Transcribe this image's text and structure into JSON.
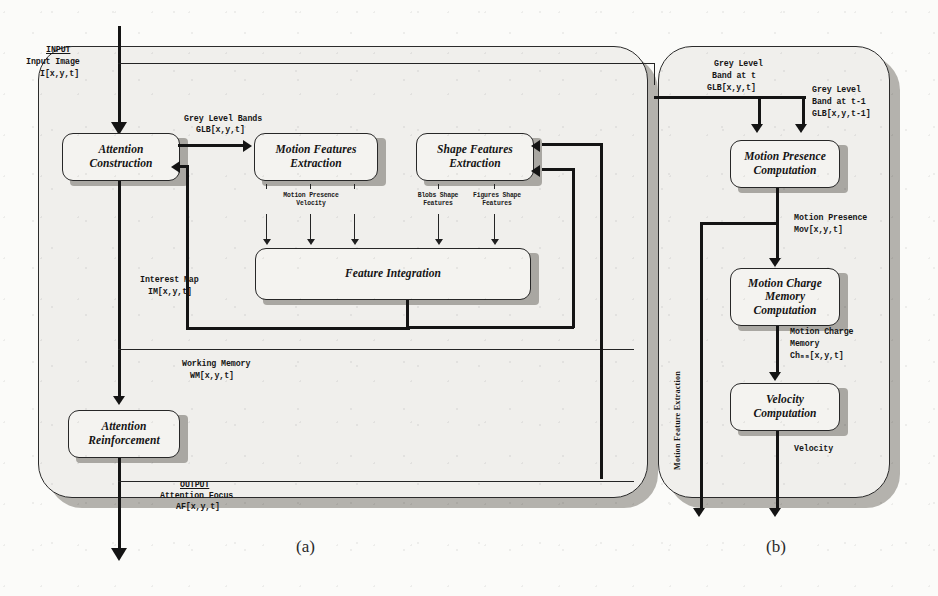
{
  "figure": {
    "captions": {
      "a": "(a)",
      "b": "(b)"
    }
  },
  "panel_a": {
    "input": {
      "heading": "INPUT",
      "line1": "Input Image",
      "line2": "I[x,y,t]"
    },
    "output": {
      "heading": "OUTPUT",
      "line1": "Attention Focus",
      "line2": "AF[x,y,t]"
    },
    "boxes": [
      {
        "id": "attention-construction",
        "line1": "Attention",
        "line2": "Construction"
      },
      {
        "id": "motion-features-extraction",
        "line1": "Motion Features",
        "line2": "Extraction"
      },
      {
        "id": "shape-features-extraction",
        "line1": "Shape Features",
        "line2": "Extraction"
      },
      {
        "id": "feature-integration",
        "line1": "Feature Integration",
        "line2": ""
      },
      {
        "id": "attention-reinforcement",
        "line1": "Attention",
        "line2": "Reinforcement"
      }
    ],
    "signals": {
      "grey_level_bands": {
        "line1": "Grey Level Bands",
        "line2": "GLB[x,y,t]"
      },
      "interest_map": {
        "line1": "Interest Map",
        "line2": "IM[x,y,t]"
      },
      "working_memory": {
        "line1": "Working Memory",
        "line2": "WM[x,y,t]"
      }
    },
    "feature_labels": [
      {
        "id": "motion-presence",
        "line1": "Motion Presence",
        "line2": "Velocity"
      },
      {
        "id": "blobs-shape",
        "line1": "Blobs Shape",
        "line2": "Features"
      },
      {
        "id": "figures-shape",
        "line1": "Figures Shape",
        "line2": "Features"
      }
    ]
  },
  "panel_b": {
    "side_label": "Motion Feature Extraction",
    "inputs": {
      "glb_t": {
        "line1": "Grey Level",
        "line2": "Band at t",
        "line3": "GLB[x,y,t]"
      },
      "glb_tm1": {
        "line1": "Grey Level",
        "line2": "Band at t-1",
        "line3": "GLB[x,y,t-1]"
      }
    },
    "boxes": [
      {
        "id": "motion-presence-computation",
        "line1": "Motion Presence",
        "line2": "Computation",
        "line3": ""
      },
      {
        "id": "motion-charge-memory-computation",
        "line1": "Motion Charge",
        "line2": "Memory",
        "line3": "Computation"
      },
      {
        "id": "velocity-computation",
        "line1": "Velocity",
        "line2": "Computation",
        "line3": ""
      }
    ],
    "signals": {
      "motion_presence": {
        "line1": "Motion Presence",
        "line2": "Mov[x,y,t]"
      },
      "motion_charge": {
        "line1": "Motion Charge",
        "line2": "Memory",
        "line3": "Chₘₘ[x,y,t]"
      },
      "velocity": {
        "line1": "Velocity"
      }
    }
  },
  "colors": {
    "ink": "#202020",
    "panel_fill": "#f0efec",
    "panel_shadow": "#b4b2ad",
    "box_fill": "#f4f3f0",
    "box_shadow": "#a9a7a2",
    "page": "#fbfbf9"
  }
}
